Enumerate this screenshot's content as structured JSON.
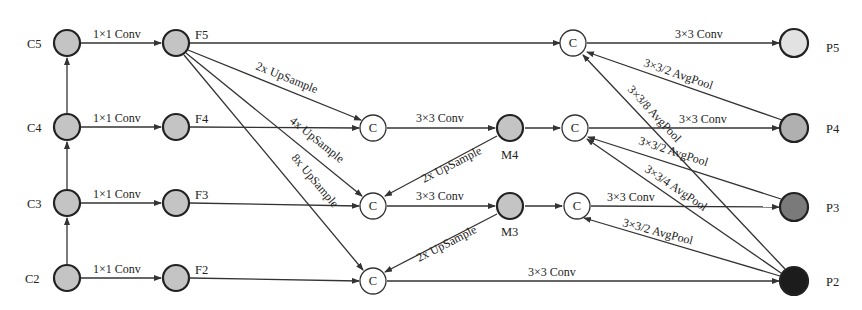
{
  "diagram": {
    "colors": {
      "input_node": "#c4c4c4",
      "mid_node": "#c4c4c4",
      "concat_node": "#ffffff",
      "P5": "#e2e2e2",
      "P4": "#b0b0b0",
      "P3": "#7a7a7a",
      "P2": "#1c1c1c"
    },
    "nodes": {
      "C5": {
        "label": "C5",
        "x": 67,
        "y": 43
      },
      "C4": {
        "label": "C4",
        "x": 67,
        "y": 127
      },
      "C3": {
        "label": "C3",
        "x": 67,
        "y": 203
      },
      "C2": {
        "label": "C2",
        "x": 67,
        "y": 278
      },
      "F5": {
        "label": "F5",
        "x": 176,
        "y": 43
      },
      "F4": {
        "label": "F4",
        "x": 176,
        "y": 127
      },
      "F3": {
        "label": "F3",
        "x": 176,
        "y": 203
      },
      "F2": {
        "label": "F2",
        "x": 176,
        "y": 278
      },
      "M4": {
        "label": "M4",
        "x": 510,
        "y": 128
      },
      "M3": {
        "label": "M3",
        "x": 510,
        "y": 206
      },
      "P5": {
        "label": "P5",
        "x": 794,
        "y": 43
      },
      "P4": {
        "label": "P4",
        "x": 794,
        "y": 128
      },
      "P3": {
        "label": "P3",
        "x": 794,
        "y": 207
      },
      "P2": {
        "label": "P2",
        "x": 794,
        "y": 281
      }
    },
    "concat_label": "C",
    "edge_labels": {
      "c5_f5": "1×1 Conv",
      "c4_f4": "1×1 Conv",
      "c3_f3": "1×1 Conv",
      "c2_f2": "1×1 Conv",
      "f5_c4": "2x UpSample",
      "f5_c3": "4x UpSample",
      "f5_c2": "8x UpSample",
      "c4_m4": "3×3 Conv",
      "c3_m3": "3×3 Conv",
      "m4_c3": "2x UpSample",
      "m3_c2": "2x UpSample",
      "c_p5": "3×3 Conv",
      "c_p4": "3×3 Conv",
      "c_p3": "3×3 Conv",
      "c_p2": "3×3 Conv",
      "p4_c5": "3×3/2 AvgPool",
      "p2_c5": "3×3/8 AvgPool",
      "p3_c4": "3×3/2 AvgPool",
      "p2_c4": "3×3/4 AvgPool",
      "p2_c3": "3×3/2 AvgPool"
    }
  }
}
